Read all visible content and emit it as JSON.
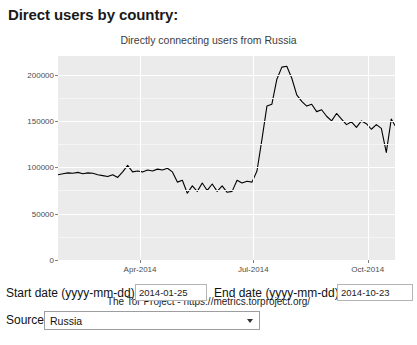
{
  "page": {
    "heading": "Direct users by country:"
  },
  "chart_data": {
    "type": "line",
    "title": "Directly connecting users from Russia",
    "caption": "The Tor Project - https://metrics.torproject.org/",
    "xlabel": "",
    "ylabel": "",
    "grid": true,
    "legend": false,
    "ylim": [
      0,
      220000
    ],
    "yticks": [
      0,
      50000,
      100000,
      150000,
      200000
    ],
    "ytick_labels": [
      "0",
      "50000",
      "100000",
      "150000",
      "200000"
    ],
    "xlim": [
      "2014-01-25",
      "2014-10-23"
    ],
    "xticks": [
      "2014-04-01",
      "2014-07-01",
      "2014-10-01"
    ],
    "xtick_labels": [
      "Apr-2014",
      "Jul-2014",
      "Oct-2014"
    ],
    "series": [
      {
        "name": "Directly connecting users from Russia",
        "color": "#000000",
        "x": [
          "2014-01-25",
          "2014-01-29",
          "2014-02-02",
          "2014-02-06",
          "2014-02-10",
          "2014-02-14",
          "2014-02-18",
          "2014-02-22",
          "2014-02-26",
          "2014-03-02",
          "2014-03-06",
          "2014-03-10",
          "2014-03-14",
          "2014-03-18",
          "2014-03-22",
          "2014-03-26",
          "2014-03-30",
          "2014-04-03",
          "2014-04-07",
          "2014-04-11",
          "2014-04-15",
          "2014-04-19",
          "2014-04-23",
          "2014-04-27",
          "2014-05-01",
          "2014-05-05",
          "2014-05-09",
          "2014-05-13",
          "2014-05-17",
          "2014-05-21",
          "2014-05-25",
          "2014-05-29",
          "2014-06-02",
          "2014-06-06",
          "2014-06-10",
          "2014-06-14",
          "2014-06-18",
          "2014-06-22",
          "2014-06-26",
          "2014-06-30",
          "2014-07-04",
          "2014-07-08",
          "2014-07-12",
          "2014-07-16",
          "2014-07-20",
          "2014-07-24",
          "2014-07-28",
          "2014-08-01",
          "2014-08-05",
          "2014-08-09",
          "2014-08-13",
          "2014-08-17",
          "2014-08-21",
          "2014-08-25",
          "2014-08-29",
          "2014-09-02",
          "2014-09-06",
          "2014-09-10",
          "2014-09-14",
          "2014-09-18",
          "2014-09-22",
          "2014-09-26",
          "2014-09-30",
          "2014-10-04",
          "2014-10-08",
          "2014-10-12",
          "2014-10-16",
          "2014-10-20",
          "2014-10-23"
        ],
        "values": [
          92000,
          93000,
          94000,
          93500,
          94500,
          93000,
          94000,
          93500,
          92000,
          91000,
          90000,
          92000,
          89000,
          95000,
          102000,
          95000,
          96000,
          95000,
          97000,
          96000,
          98000,
          97000,
          99000,
          95000,
          84000,
          86000,
          72000,
          80000,
          74000,
          83000,
          75000,
          82000,
          74000,
          80000,
          73000,
          74000,
          86000,
          83000,
          85000,
          84000,
          96000,
          130000,
          166000,
          168000,
          195000,
          208000,
          209000,
          196000,
          178000,
          171000,
          166000,
          168000,
          160000,
          162000,
          155000,
          150000,
          158000,
          152000,
          146000,
          149000,
          143000,
          150000,
          147000,
          141000,
          146000,
          142000,
          116000,
          152000,
          145000
        ]
      }
    ]
  },
  "form": {
    "start_date_label": "Start date (yyyy-mm-dd):",
    "start_date_value": "2014-01-25",
    "start_date_placeholder": "yyyy-mm-dd",
    "end_date_label": "End date (yyyy-mm-dd):",
    "end_date_value": "2014-10-23",
    "end_date_placeholder": "yyyy-mm-dd",
    "source_label": "Source:",
    "source_value": "Russia"
  }
}
